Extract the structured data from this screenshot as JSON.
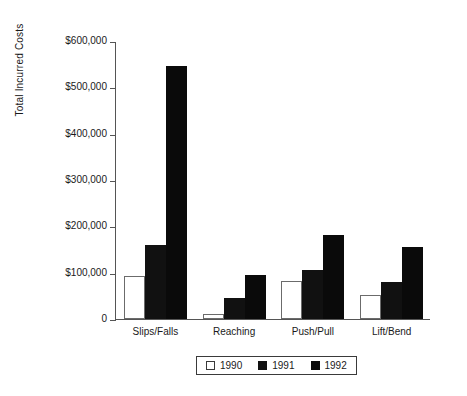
{
  "chart_data": {
    "type": "bar",
    "title": "",
    "xlabel": "",
    "ylabel": "Total Incurred Costs",
    "categories": [
      "Slips/Falls",
      "Reaching",
      "Push/Pull",
      "Lift/Bend"
    ],
    "series": [
      {
        "name": "1990",
        "color": "#ffffff",
        "values": [
          92000,
          10000,
          82000,
          52000
        ]
      },
      {
        "name": "1991",
        "color": "#111111",
        "values": [
          160000,
          45000,
          105000,
          80000
        ]
      },
      {
        "name": "1992",
        "color": "#0a0a0a",
        "values": [
          545000,
          95000,
          182000,
          155000
        ]
      }
    ],
    "ylim": [
      0,
      600000
    ],
    "ytick_values": [
      0,
      100000,
      200000,
      300000,
      400000,
      500000,
      600000
    ],
    "ytick_labels": [
      "0",
      "$100,000",
      "$200,000",
      "$300,000",
      "$400,000",
      "$500,000",
      "$600,000"
    ],
    "grid": false,
    "legend_position": "bottom-center",
    "legend_entries": [
      "1990",
      "1991",
      "1992"
    ]
  }
}
